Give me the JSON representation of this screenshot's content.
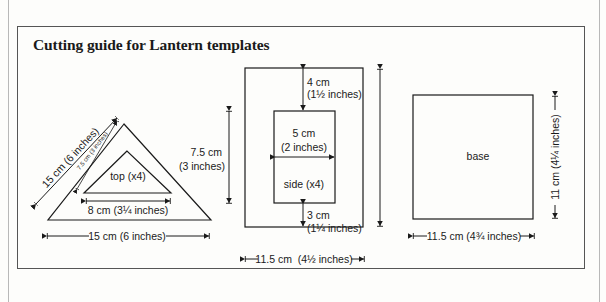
{
  "title": "Cutting guide for Lantern templates",
  "pieces": {
    "triangle": {
      "inner_label": "top (x4)",
      "outer_side": "15 cm (6 inches)",
      "inner_side": "7.5 cm (3 inches)",
      "inner_base": "8 cm (3¼ inches)",
      "outer_base": "15 cm (6 inches)"
    },
    "side": {
      "label": "side (x4)",
      "height_cm": "7.5 cm",
      "height_in": "(3 inches)",
      "top_margin_cm": "4 cm",
      "top_margin_in": "(1½ inches)",
      "window_width_cm": "5 cm",
      "window_width_in": "(2 inches)",
      "bottom_margin_cm": "3 cm",
      "bottom_margin_in": "(1¼ inches)",
      "width": "11.5 cm  (4½ inches)"
    },
    "base": {
      "label": "base",
      "height": "11 cm (4¼ inches)",
      "width": "11.5 cm (4¾ inches)"
    }
  },
  "colors": {
    "line": "#1a1a1a",
    "frame": "#555555",
    "background": "#fdfdfb"
  }
}
